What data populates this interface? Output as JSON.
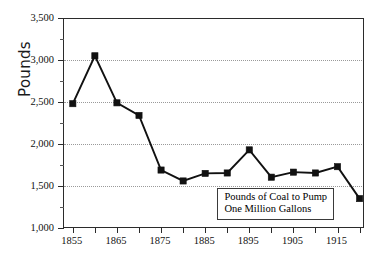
{
  "chart_data": {
    "type": "line",
    "title": "",
    "xlabel": "",
    "ylabel": "Pounds",
    "xlim": [
      1853,
      1921
    ],
    "ylim": [
      1000,
      3500
    ],
    "grid": true,
    "legend_position": "inside-bottom-right",
    "annotations": [
      {
        "text_line1": "Pounds of Coal to Pump",
        "text_line2": "One Million Gallons"
      }
    ],
    "x": [
      1855,
      1860,
      1865,
      1870,
      1875,
      1880,
      1885,
      1890,
      1895,
      1900,
      1905,
      1910,
      1915,
      1920
    ],
    "values": [
      2480,
      3050,
      2490,
      2340,
      1690,
      1560,
      1650,
      1655,
      1930,
      1605,
      1665,
      1655,
      1730,
      1350
    ],
    "series": [
      {
        "name": "Pounds of Coal to Pump One Million Gallons",
        "values": [
          2480,
          3050,
          2490,
          2340,
          1690,
          1560,
          1650,
          1655,
          1930,
          1605,
          1665,
          1655,
          1730,
          1350
        ]
      }
    ],
    "y_ticks_major": [
      1000,
      1500,
      2000,
      2500,
      3000,
      3500
    ],
    "y_ticklabels": [
      "1,000",
      "1,500",
      "2,000",
      "2,500",
      "3,000",
      "3,500"
    ],
    "y_ticks_minor": [
      1250,
      1750,
      2250,
      2750,
      3250
    ],
    "x_ticks": [
      1855,
      1860,
      1865,
      1870,
      1875,
      1880,
      1885,
      1890,
      1895,
      1900,
      1905,
      1910,
      1915,
      1920
    ],
    "x_ticklabels_shown": [
      {
        "value": 1855,
        "label": "1855"
      },
      {
        "value": 1865,
        "label": "1865"
      },
      {
        "value": 1875,
        "label": "1875"
      },
      {
        "value": 1885,
        "label": "1885"
      },
      {
        "value": 1895,
        "label": "1895"
      },
      {
        "value": 1905,
        "label": "1905"
      },
      {
        "value": 1915,
        "label": "1915"
      }
    ],
    "colors": {
      "line": "#111111",
      "marker": "#111111",
      "grid": "#9a9a9a",
      "axis": "#2b2b2b",
      "background": "#ffffff"
    }
  }
}
